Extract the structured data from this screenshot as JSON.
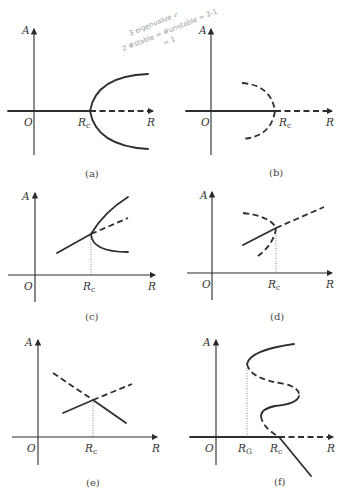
{
  "figure": {
    "axis_labels": {
      "y": "A",
      "x": "R",
      "origin": "O"
    },
    "critical_label": {
      "main": "R",
      "sub": "c"
    },
    "saddle_label": {
      "main": "R",
      "sub": "G"
    },
    "panels": [
      {
        "id": "a",
        "caption": "(a)",
        "description": "Supercritical pitchfork: solid A=0 for R<Rc, dashed A=0 for R>Rc, solid parabola branches opening right from Rc"
      },
      {
        "id": "b",
        "caption": "(b)",
        "description": "Subcritical pitchfork: solid A=0 for R<Rc, dashed A=0 for R>Rc, dashed semicircle branches opening left from Rc"
      },
      {
        "id": "c",
        "caption": "(c)",
        "description": "Imperfect/transcritical-like: solid line through Rc, above Rc splits into solid upper branch, dashed middle, solid lower branch"
      },
      {
        "id": "d",
        "caption": "(d)",
        "description": "Solid line meets dashed fold at Rc; continues dashed beyond Rc"
      },
      {
        "id": "e",
        "caption": "(e)",
        "description": "Transcritical: two lines cross at Rc exchanging stability (dashed/solid)"
      },
      {
        "id": "f",
        "caption": "(f)",
        "description": "S-shaped hysteresis curve with fold at RG; solid/dashed alternating; crosses R-axis at Rc"
      }
    ]
  },
  "annotation": {
    "handwritten_lines": [
      "3 eigenvalue ✓",
      "2 #stable = #unstable = 2-1",
      "= 1"
    ]
  }
}
